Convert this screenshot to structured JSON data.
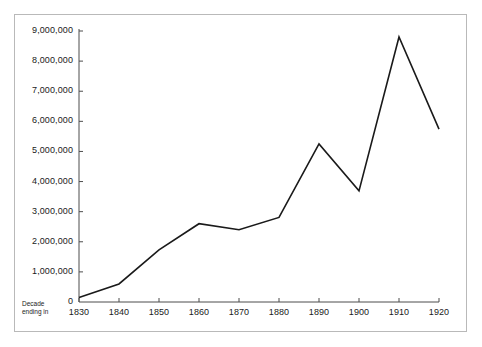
{
  "chart_data": {
    "type": "line",
    "title": "",
    "subtitle": "",
    "xlabel": "Decade ending in",
    "ylabel": "",
    "categories": [
      "1830",
      "1840",
      "1850",
      "1860",
      "1870",
      "1880",
      "1890",
      "1900",
      "1910",
      "1920"
    ],
    "x": [
      1830,
      1840,
      1850,
      1860,
      1870,
      1880,
      1890,
      1900,
      1910,
      1920
    ],
    "values": [
      150000,
      600000,
      1730000,
      2600000,
      2400000,
      2810000,
      5250000,
      3690000,
      8800000,
      5740000
    ],
    "series": [
      {
        "name": "Immigration",
        "values": [
          150000,
          600000,
          1730000,
          2600000,
          2400000,
          2810000,
          5250000,
          3690000,
          8800000,
          5740000
        ]
      }
    ],
    "ylim": [
      0,
      9000000
    ],
    "xlim": [
      1830,
      1920
    ],
    "ytick_labels": [
      "0",
      "1,000,000",
      "2,000,000",
      "3,000,000",
      "4,000,000",
      "5,000,000",
      "6,000,000",
      "7,000,000",
      "8,000,000",
      "9,000,000"
    ],
    "ytick_values": [
      0,
      1000000,
      2000000,
      3000000,
      4000000,
      5000000,
      6000000,
      7000000,
      8000000,
      9000000
    ],
    "xtick_labels": [
      "1830",
      "1840",
      "1850",
      "1860",
      "1870",
      "1880",
      "1890",
      "1900",
      "1910",
      "1920"
    ],
    "grid": false,
    "legend": false,
    "legend_position": "none",
    "line_color": "#1a1a1a",
    "axis_color": "#4d4d4d",
    "border_color": "#b9b9b9",
    "background_color": "#ffffff"
  },
  "axis_caption": {
    "line1": "Decade",
    "line2": "ending in"
  }
}
